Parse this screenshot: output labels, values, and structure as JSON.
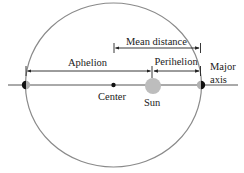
{
  "diagram": {
    "labels": {
      "mean_distance": "Mean distance",
      "aphelion": "Aphelion",
      "perihelion": "Perihelion",
      "major_axis_line1": "Major",
      "major_axis_line2": "axis",
      "center": "Center",
      "sun": "Sun"
    },
    "colors": {
      "orbit": "#8a8a8a",
      "axis_line": "#555555",
      "sun": "#bdbdbd",
      "planet_dark": "#111111",
      "planet_light": "#b0b0b0",
      "arrows": "#222222"
    }
  }
}
